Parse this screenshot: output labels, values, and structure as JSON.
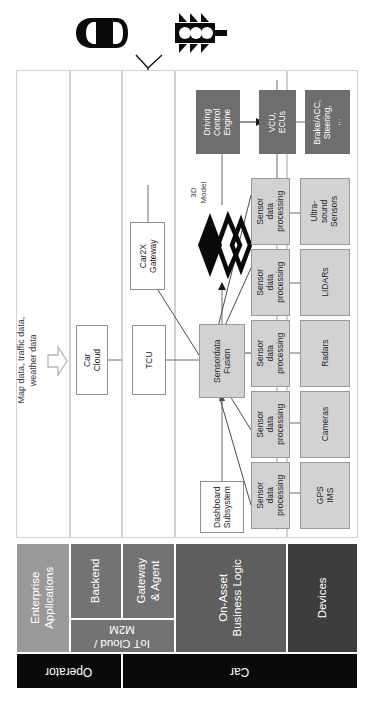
{
  "diagram": {
    "orientation": "rotated-90",
    "colors": {
      "lane_border": "#d2d2d2",
      "box_border": "#8f8f8f",
      "box_fill_light": "#d2d2d2",
      "box_fill_dark": "#6e6e6e",
      "band_enterprise": "#999999",
      "band_backend": "#737373",
      "band_gateway": "#737373",
      "band_iot": "#737373",
      "band_onasset": "#5e5e5e",
      "band_devices": "#3d3d3d",
      "band_owner": "#0a0a0a",
      "line": "#6b6b6b",
      "text_light": "#ffffff",
      "text_dark": "#222222"
    }
  },
  "icons": {
    "car": "car-top-view-icon",
    "traffic_light": "traffic-light-icon",
    "antenna": "antenna-icon",
    "block_arrow": "block-arrow-icon",
    "model3d": "3d-model-chevrons-icon"
  },
  "external_inputs": {
    "data_sources_note": "Map data, traffic data,\nweather data",
    "data_sources_line1": "Map data, traffic data,",
    "data_sources_line2": "weather data"
  },
  "boxes": {
    "car_cloud": {
      "line1": "Car",
      "line2": "Cloud"
    },
    "tcu": {
      "line1": "TCU"
    },
    "car2x_gateway": {
      "line1": "Car2X",
      "line2": "Gateway"
    },
    "sensordata_fusion": {
      "line1": "Sensordata",
      "line2": "Fusion"
    },
    "dashboard_subsystem": {
      "line1": "Dashboard",
      "line2": "Subsystem"
    },
    "driving_control_engine": {
      "line1": "Driving",
      "line2": "Control",
      "line3": "Engine"
    },
    "vcu_ecus": {
      "line1": "VCU,",
      "line2": "ECUs"
    },
    "actuators": {
      "line1": "Brake/ACC,",
      "line2": "Steering,",
      "line3": "..."
    },
    "model_3d": {
      "line1": "3D",
      "line2": "Model"
    }
  },
  "sensor_processing": {
    "label_line1": "Sensor",
    "label_line2": "data",
    "label_line3": "processing",
    "count": 5
  },
  "sensors": [
    {
      "id": "ultrasound",
      "line1": "Ultra-",
      "line2": "sound",
      "line3": "Sensors"
    },
    {
      "id": "lidars",
      "line1": "LIDARs",
      "line2": "",
      "line3": ""
    },
    {
      "id": "radars",
      "line1": "Radars",
      "line2": "",
      "line3": ""
    },
    {
      "id": "cameras",
      "line1": "Cameras",
      "line2": "",
      "line3": ""
    },
    {
      "id": "gps_ims",
      "line1": "GPS",
      "line2": "IMS",
      "line3": ""
    }
  ],
  "layers": [
    {
      "id": "enterprise_applications",
      "line1": "Enterprise",
      "line2": "Applications"
    },
    {
      "id": "backend",
      "line1": "Backend",
      "line2": ""
    },
    {
      "id": "gateway_agent",
      "line1": "Gateway",
      "line2": "& Agent"
    },
    {
      "id": "iot_cloud_m2m",
      "line1": "IoT Cloud /",
      "line2": "M2M"
    },
    {
      "id": "on_asset_business_logic",
      "line1": "On-Asset",
      "line2": "Business Logic"
    },
    {
      "id": "devices",
      "line1": "Devices",
      "line2": ""
    }
  ],
  "owners": [
    {
      "id": "operator",
      "label": "Operator"
    },
    {
      "id": "car",
      "label": "Car"
    }
  ]
}
